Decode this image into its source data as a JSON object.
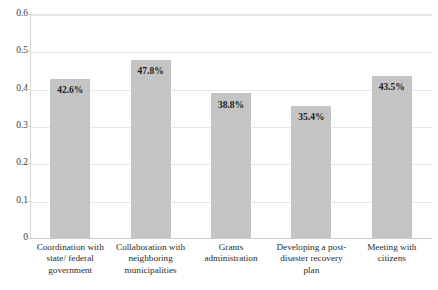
{
  "chart_data": {
    "type": "bar",
    "title": "",
    "xlabel": "",
    "ylabel": "",
    "ylim": [
      0,
      0.6
    ],
    "grid": true,
    "legend": "none",
    "orientation": "vertical",
    "bar_color": "#c4c4c4",
    "categories": [
      "Coordination with state/ federal government",
      "Collaboration with neighboring municipalities",
      "Grants administration",
      "Developing a post-disaster recovery plan",
      "Meeting with citizens"
    ],
    "category_lines": [
      [
        "Coordination with",
        "state/ federal",
        "government"
      ],
      [
        "Collaboration with",
        "neighboring",
        "municipalities"
      ],
      [
        "Grants",
        "administration"
      ],
      [
        "Developing a post-",
        "disaster recovery",
        "plan"
      ],
      [
        "Meeting with",
        "citizens"
      ]
    ],
    "values": [
      0.426,
      0.478,
      0.388,
      0.354,
      0.435
    ],
    "data_labels": [
      "42.6%",
      "47.8%",
      "38.8%",
      "35.4%",
      "43.5%"
    ],
    "yticks": [
      0.6,
      0.5,
      0.4,
      0.3,
      0.2,
      0.1,
      0
    ],
    "ytick_labels": [
      "0.6",
      "0.5",
      "0.4",
      "0.3",
      "0.2",
      "0.1",
      "0"
    ]
  },
  "header": {
    "clipped_title": ""
  }
}
